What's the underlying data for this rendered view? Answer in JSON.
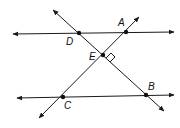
{
  "diagram": {
    "points": {
      "A": {
        "label": "A",
        "x": 126,
        "y": 32
      },
      "B": {
        "label": "B",
        "x": 146,
        "y": 95
      },
      "C": {
        "label": "C",
        "x": 63,
        "y": 97
      },
      "D": {
        "label": "D",
        "x": 79,
        "y": 33
      },
      "E": {
        "label": "E",
        "x": 103,
        "y": 55
      }
    },
    "lines": [
      {
        "name": "top-parallel-line",
        "through": [
          "D",
          "A"
        ]
      },
      {
        "name": "bottom-parallel-line",
        "through": [
          "C",
          "B"
        ]
      },
      {
        "name": "transversal-DB",
        "through": [
          "D",
          "E",
          "B"
        ]
      },
      {
        "name": "transversal-CA",
        "through": [
          "C",
          "E",
          "A"
        ]
      }
    ],
    "right_angle_at": "E",
    "colors": {
      "stroke": "#1a1a1a",
      "background": "#ffffff"
    }
  }
}
